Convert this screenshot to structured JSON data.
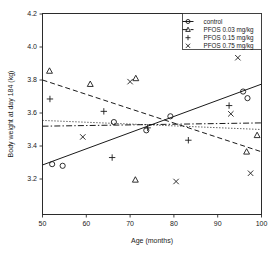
{
  "chart_data": {
    "type": "scatter",
    "title": "",
    "xlabel": "Age (months)",
    "ylabel": "Body weight at day 184 (kg)",
    "xlim": [
      50,
      100
    ],
    "ylim": [
      3.1,
      4.2
    ],
    "xticks": [
      50,
      60,
      70,
      80,
      90,
      100
    ],
    "yticks": [
      3.2,
      3.4,
      3.6,
      3.8,
      4.0,
      4.2
    ],
    "xtick_labels": [
      "50",
      "60",
      "70",
      "80",
      "90",
      "100"
    ],
    "ytick_labels": [
      "3.2",
      "3.4",
      "3.6",
      "3.8",
      "4.0",
      "4.2"
    ],
    "grid": false,
    "legend_position": "top-right",
    "series": [
      {
        "name": "control",
        "marker": "circle",
        "line_style": "solid",
        "points": [
          {
            "x": 52.2,
            "y": 3.29
          },
          {
            "x": 54.6,
            "y": 3.28
          },
          {
            "x": 66.3,
            "y": 3.545
          },
          {
            "x": 73.7,
            "y": 3.495
          },
          {
            "x": 79.2,
            "y": 3.58
          },
          {
            "x": 95.8,
            "y": 3.73
          },
          {
            "x": 96.8,
            "y": 3.69
          }
        ],
        "fit_line": {
          "x1": 50,
          "y1": 3.285,
          "x2": 100,
          "y2": 3.775
        }
      },
      {
        "name": "PFOS 0.03 mg/kg",
        "marker": "triangle",
        "line_style": "dashed",
        "points": [
          {
            "x": 51.6,
            "y": 3.855
          },
          {
            "x": 60.9,
            "y": 3.775
          },
          {
            "x": 71.3,
            "y": 3.81
          },
          {
            "x": 71.2,
            "y": 3.195
          },
          {
            "x": 96.6,
            "y": 3.365
          },
          {
            "x": 99.0,
            "y": 3.465
          }
        ],
        "fit_line": {
          "x1": 50,
          "y1": 3.8,
          "x2": 100,
          "y2": 3.365
        }
      },
      {
        "name": "PFOS 0.15 mg/kg",
        "marker": "plus",
        "line_style": "dotted",
        "points": [
          {
            "x": 51.7,
            "y": 3.685
          },
          {
            "x": 64.0,
            "y": 3.61
          },
          {
            "x": 65.9,
            "y": 3.33
          },
          {
            "x": 74.0,
            "y": 3.51
          },
          {
            "x": 83.3,
            "y": 3.435
          },
          {
            "x": 92.6,
            "y": 3.645
          }
        ],
        "fit_line": {
          "x1": 50,
          "y1": 3.555,
          "x2": 100,
          "y2": 3.5
        }
      },
      {
        "name": "PFOS 0.75 mg/kg",
        "marker": "cross",
        "line_style": "dashdot",
        "points": [
          {
            "x": 59.2,
            "y": 3.455
          },
          {
            "x": 70.0,
            "y": 3.79
          },
          {
            "x": 80.5,
            "y": 3.185
          },
          {
            "x": 93.0,
            "y": 3.595
          },
          {
            "x": 94.6,
            "y": 3.935
          },
          {
            "x": 97.5,
            "y": 3.235
          }
        ],
        "fit_line": {
          "x1": 50,
          "y1": 3.52,
          "x2": 100,
          "y2": 3.54
        }
      }
    ]
  },
  "legend": {
    "entries": [
      {
        "label": "control",
        "marker": "circle",
        "line_style": "solid"
      },
      {
        "label": "PFOS 0.03 mg/kg",
        "marker": "triangle",
        "line_style": "dashed"
      },
      {
        "label": "PFOS 0.15 mg/kg",
        "marker": "plus",
        "line_style": "none"
      },
      {
        "label": "PFOS 0.75 mg/kg",
        "marker": "cross",
        "line_style": "none"
      }
    ]
  },
  "colors": {
    "axis": "#2b2b2b",
    "text": "#1a1a1a",
    "marker": "#1a1a1a",
    "background": "#ffffff"
  }
}
